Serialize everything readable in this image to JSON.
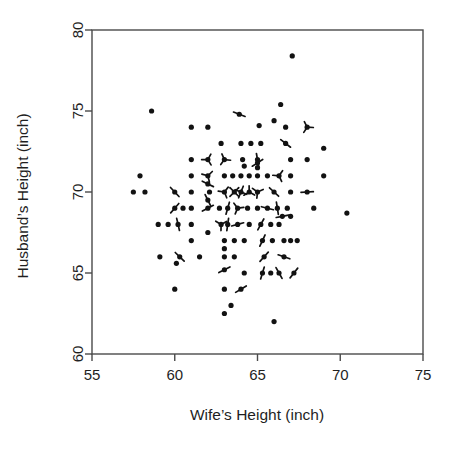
{
  "chart_data": {
    "type": "scatter",
    "title": "",
    "subtitle": "",
    "xlabel": "Wife’s Height (inch)",
    "ylabel": "Husband’s Height (inch)",
    "xlim": [
      55,
      75
    ],
    "ylim": [
      60,
      80
    ],
    "xticks": [
      55,
      60,
      65,
      70,
      75
    ],
    "yticks": [
      60,
      65,
      70,
      75,
      80
    ],
    "xtick_labels": [
      "55",
      "60",
      "65",
      "70",
      "75"
    ],
    "ytick_labels": [
      "60",
      "65",
      "70",
      "75",
      "80"
    ],
    "grid": false,
    "legend": null,
    "legend_position": "none",
    "marker": "sunflower",
    "marker_note": "Filled dot per location; radiating short line segments (petals) encode the number of coincident observations at that location.",
    "point_color": "#121212",
    "axis_color": "#4a4a4a",
    "background_color": "#ffffff",
    "n_points_plotted": 204,
    "x_name": "wife_height_inch",
    "y_name": "husband_height_inch",
    "points": [
      {
        "x": 67.1,
        "y": 78.4,
        "n": 1
      },
      {
        "x": 66.4,
        "y": 75.4,
        "n": 1
      },
      {
        "x": 58.6,
        "y": 75.0,
        "n": 1
      },
      {
        "x": 63.9,
        "y": 74.8,
        "n": 2
      },
      {
        "x": 66.0,
        "y": 74.4,
        "n": 1
      },
      {
        "x": 65.1,
        "y": 74.1,
        "n": 1
      },
      {
        "x": 61.0,
        "y": 74.0,
        "n": 1
      },
      {
        "x": 62.0,
        "y": 74.0,
        "n": 1
      },
      {
        "x": 66.7,
        "y": 74.0,
        "n": 1
      },
      {
        "x": 68.0,
        "y": 74.0,
        "n": 3
      },
      {
        "x": 62.8,
        "y": 73.0,
        "n": 1
      },
      {
        "x": 64.0,
        "y": 73.0,
        "n": 1
      },
      {
        "x": 64.6,
        "y": 73.0,
        "n": 1
      },
      {
        "x": 65.2,
        "y": 73.0,
        "n": 1
      },
      {
        "x": 66.7,
        "y": 73.0,
        "n": 2
      },
      {
        "x": 69.0,
        "y": 72.7,
        "n": 1
      },
      {
        "x": 61.0,
        "y": 72.0,
        "n": 1
      },
      {
        "x": 62.0,
        "y": 72.0,
        "n": 3
      },
      {
        "x": 63.0,
        "y": 72.0,
        "n": 3
      },
      {
        "x": 64.1,
        "y": 72.0,
        "n": 1
      },
      {
        "x": 65.0,
        "y": 72.0,
        "n": 2
      },
      {
        "x": 65.0,
        "y": 71.8,
        "n": 2
      },
      {
        "x": 67.0,
        "y": 72.0,
        "n": 1
      },
      {
        "x": 68.0,
        "y": 72.0,
        "n": 1
      },
      {
        "x": 64.2,
        "y": 71.6,
        "n": 1
      },
      {
        "x": 65.0,
        "y": 71.5,
        "n": 1
      },
      {
        "x": 57.9,
        "y": 71.0,
        "n": 1
      },
      {
        "x": 61.0,
        "y": 71.0,
        "n": 1
      },
      {
        "x": 62.0,
        "y": 71.0,
        "n": 3
      },
      {
        "x": 63.0,
        "y": 71.0,
        "n": 1
      },
      {
        "x": 63.5,
        "y": 71.0,
        "n": 1
      },
      {
        "x": 64.0,
        "y": 71.0,
        "n": 1
      },
      {
        "x": 64.5,
        "y": 71.0,
        "n": 1
      },
      {
        "x": 65.0,
        "y": 71.0,
        "n": 1
      },
      {
        "x": 65.6,
        "y": 71.0,
        "n": 1
      },
      {
        "x": 66.3,
        "y": 71.0,
        "n": 3
      },
      {
        "x": 67.0,
        "y": 71.0,
        "n": 1
      },
      {
        "x": 69.0,
        "y": 71.0,
        "n": 1
      },
      {
        "x": 62.0,
        "y": 70.5,
        "n": 2
      },
      {
        "x": 57.5,
        "y": 70.0,
        "n": 1
      },
      {
        "x": 58.2,
        "y": 70.0,
        "n": 1
      },
      {
        "x": 60.0,
        "y": 70.0,
        "n": 2
      },
      {
        "x": 61.0,
        "y": 70.0,
        "n": 1
      },
      {
        "x": 62.1,
        "y": 70.0,
        "n": 1
      },
      {
        "x": 63.0,
        "y": 70.0,
        "n": 3
      },
      {
        "x": 63.6,
        "y": 70.0,
        "n": 4
      },
      {
        "x": 64.0,
        "y": 70.0,
        "n": 4
      },
      {
        "x": 64.5,
        "y": 70.0,
        "n": 3
      },
      {
        "x": 65.0,
        "y": 70.0,
        "n": 3
      },
      {
        "x": 66.0,
        "y": 70.0,
        "n": 2
      },
      {
        "x": 67.0,
        "y": 70.0,
        "n": 1
      },
      {
        "x": 68.0,
        "y": 70.0,
        "n": 2
      },
      {
        "x": 62.0,
        "y": 69.5,
        "n": 2
      },
      {
        "x": 60.0,
        "y": 69.0,
        "n": 2
      },
      {
        "x": 60.5,
        "y": 69.0,
        "n": 1
      },
      {
        "x": 61.0,
        "y": 69.0,
        "n": 1
      },
      {
        "x": 62.0,
        "y": 69.0,
        "n": 2
      },
      {
        "x": 62.7,
        "y": 69.0,
        "n": 1
      },
      {
        "x": 63.2,
        "y": 69.0,
        "n": 2
      },
      {
        "x": 63.8,
        "y": 69.0,
        "n": 3
      },
      {
        "x": 64.4,
        "y": 69.0,
        "n": 1
      },
      {
        "x": 65.0,
        "y": 69.0,
        "n": 1
      },
      {
        "x": 65.6,
        "y": 69.0,
        "n": 2
      },
      {
        "x": 66.2,
        "y": 69.0,
        "n": 2
      },
      {
        "x": 66.8,
        "y": 69.0,
        "n": 1
      },
      {
        "x": 68.4,
        "y": 69.0,
        "n": 1
      },
      {
        "x": 70.4,
        "y": 68.7,
        "n": 1
      },
      {
        "x": 66.5,
        "y": 68.5,
        "n": 2
      },
      {
        "x": 67.0,
        "y": 68.5,
        "n": 1
      },
      {
        "x": 59.0,
        "y": 68.0,
        "n": 1
      },
      {
        "x": 59.6,
        "y": 68.0,
        "n": 1
      },
      {
        "x": 60.2,
        "y": 68.0,
        "n": 2
      },
      {
        "x": 61.0,
        "y": 68.0,
        "n": 1
      },
      {
        "x": 62.8,
        "y": 68.0,
        "n": 3
      },
      {
        "x": 63.2,
        "y": 68.0,
        "n": 2
      },
      {
        "x": 63.8,
        "y": 68.0,
        "n": 2
      },
      {
        "x": 64.5,
        "y": 68.0,
        "n": 1
      },
      {
        "x": 65.2,
        "y": 68.0,
        "n": 2
      },
      {
        "x": 65.8,
        "y": 68.0,
        "n": 1
      },
      {
        "x": 66.3,
        "y": 68.0,
        "n": 1
      },
      {
        "x": 62.0,
        "y": 67.5,
        "n": 1
      },
      {
        "x": 61.0,
        "y": 67.0,
        "n": 1
      },
      {
        "x": 63.0,
        "y": 67.0,
        "n": 1
      },
      {
        "x": 63.6,
        "y": 67.0,
        "n": 1
      },
      {
        "x": 64.2,
        "y": 67.0,
        "n": 1
      },
      {
        "x": 65.3,
        "y": 67.0,
        "n": 2
      },
      {
        "x": 65.9,
        "y": 67.0,
        "n": 1
      },
      {
        "x": 66.6,
        "y": 67.0,
        "n": 1
      },
      {
        "x": 67.0,
        "y": 67.0,
        "n": 1
      },
      {
        "x": 67.4,
        "y": 67.0,
        "n": 1
      },
      {
        "x": 63.0,
        "y": 66.5,
        "n": 1
      },
      {
        "x": 59.1,
        "y": 66.0,
        "n": 1
      },
      {
        "x": 60.3,
        "y": 66.0,
        "n": 2
      },
      {
        "x": 61.5,
        "y": 66.0,
        "n": 1
      },
      {
        "x": 63.0,
        "y": 66.0,
        "n": 1
      },
      {
        "x": 63.6,
        "y": 66.0,
        "n": 1
      },
      {
        "x": 65.4,
        "y": 66.0,
        "n": 2
      },
      {
        "x": 66.6,
        "y": 66.0,
        "n": 2
      },
      {
        "x": 60.1,
        "y": 65.6,
        "n": 1
      },
      {
        "x": 63.0,
        "y": 65.2,
        "n": 2
      },
      {
        "x": 64.2,
        "y": 65.0,
        "n": 1
      },
      {
        "x": 65.3,
        "y": 65.0,
        "n": 2
      },
      {
        "x": 65.8,
        "y": 65.0,
        "n": 1
      },
      {
        "x": 66.3,
        "y": 65.0,
        "n": 2
      },
      {
        "x": 67.2,
        "y": 65.0,
        "n": 2
      },
      {
        "x": 60.0,
        "y": 64.0,
        "n": 1
      },
      {
        "x": 63.0,
        "y": 64.0,
        "n": 1
      },
      {
        "x": 64.0,
        "y": 64.0,
        "n": 2
      },
      {
        "x": 63.4,
        "y": 63.0,
        "n": 1
      },
      {
        "x": 63.0,
        "y": 62.5,
        "n": 1
      },
      {
        "x": 66.0,
        "y": 62.0,
        "n": 1
      }
    ]
  },
  "figure": {
    "plot_box": {
      "left": 92,
      "top": 30,
      "right": 423,
      "bottom": 354
    },
    "x_axis_title": "Wife’s Height (inch)",
    "y_axis_title": "Husband’s Height (inch)"
  }
}
